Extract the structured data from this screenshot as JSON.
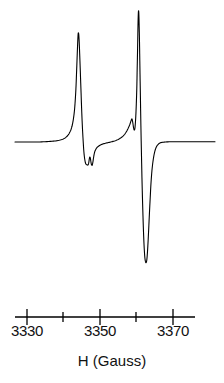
{
  "chart_data": {
    "type": "line",
    "title": "",
    "subtitle": "",
    "xlabel": "H (Gauss)",
    "ylabel": "",
    "xlim": [
      3325.4,
      3378.4
    ],
    "ylim": [
      -1.16,
      1.06
    ],
    "grid": false,
    "legend": null,
    "axis": {
      "ticks": [
        3330,
        3340,
        3350,
        3360,
        3370
      ],
      "tick_labels": [
        "3330",
        "",
        "3350",
        "",
        "3370"
      ],
      "labeled_ticks": [
        3330,
        3350,
        3370
      ],
      "minor_ticks": [
        3340,
        3360
      ],
      "line_color": "#000000"
    },
    "annotations": [],
    "series": [
      {
        "name": "EPR first-derivative signal",
        "color": "#000000",
        "description": "Two-line first-derivative EPR spectrum with small hyperfine shoulders",
        "features": [
          {
            "name": "left-peak-maximum",
            "x": 3337.3,
            "y": 0.96
          },
          {
            "name": "left-zero-crossing",
            "x": 3338.6,
            "y": 0.0
          },
          {
            "name": "left-hyperfine-shoulder",
            "x": 3340.9,
            "y": -0.08
          },
          {
            "name": "left-peak-minimum",
            "x": 3340.5,
            "y": -1.16
          },
          {
            "name": "right-hyperfine-shoulder",
            "x": 3352.4,
            "y": 0.17
          },
          {
            "name": "right-peak-maximum",
            "x": 3354.1,
            "y": 1.06
          },
          {
            "name": "right-zero-crossing",
            "x": 3355.2,
            "y": 0.0
          },
          {
            "name": "right-peak-minimum",
            "x": 3356.2,
            "y": -0.97
          }
        ],
        "points_px": [
          [
            15,
            142
          ],
          [
            22,
            142
          ],
          [
            30,
            142
          ],
          [
            38,
            142
          ],
          [
            45,
            141.7
          ],
          [
            52,
            141.3
          ],
          [
            57,
            140.7
          ],
          [
            61,
            139.8
          ],
          [
            64,
            138.6
          ],
          [
            66,
            137.2
          ],
          [
            68,
            135.2
          ],
          [
            69.5,
            132.8
          ],
          [
            71,
            129.5
          ],
          [
            72.3,
            125
          ],
          [
            73.4,
            119
          ],
          [
            74.4,
            111
          ],
          [
            75.2,
            101
          ],
          [
            75.9,
            89
          ],
          [
            76.5,
            74
          ],
          [
            77.1,
            58
          ],
          [
            77.6,
            45
          ],
          [
            78,
            36
          ],
          [
            78.3,
            33
          ],
          [
            78.7,
            34
          ],
          [
            79.1,
            40
          ],
          [
            79.6,
            52
          ],
          [
            80.2,
            68
          ],
          [
            80.9,
            88
          ],
          [
            81.6,
            108
          ],
          [
            82.3,
            125
          ],
          [
            83.1,
            140
          ],
          [
            83.9,
            152
          ],
          [
            84.7,
            159
          ],
          [
            85.5,
            163
          ],
          [
            86.3,
            164.5
          ],
          [
            87.1,
            164.8
          ],
          [
            88,
            165
          ],
          [
            88.7,
            163
          ],
          [
            89.3,
            159
          ],
          [
            89.8,
            157
          ],
          [
            90.3,
            158
          ],
          [
            90.8,
            161
          ],
          [
            91.3,
            164
          ],
          [
            91.8,
            165.2
          ],
          [
            92.3,
            165
          ],
          [
            92.9,
            162
          ],
          [
            93.5,
            158
          ],
          [
            94.2,
            154
          ],
          [
            95,
            151
          ],
          [
            96,
            149
          ],
          [
            97,
            147.5
          ],
          [
            98.5,
            146.2
          ],
          [
            100,
            145.2
          ],
          [
            102,
            144.3
          ],
          [
            104,
            143.6
          ],
          [
            107,
            142.9
          ],
          [
            110,
            142.2
          ],
          [
            113,
            141.4
          ],
          [
            116,
            140.4
          ],
          [
            119,
            139
          ],
          [
            122,
            137
          ],
          [
            124.5,
            134.5
          ],
          [
            126.5,
            131.5
          ],
          [
            128.3,
            128
          ],
          [
            129.8,
            124.5
          ],
          [
            130.8,
            121.5
          ],
          [
            131.5,
            119.5
          ],
          [
            132,
            119
          ],
          [
            132.5,
            121
          ],
          [
            133,
            124
          ],
          [
            133.6,
            128
          ],
          [
            134.2,
            130
          ],
          [
            134.8,
            129
          ],
          [
            135.3,
            124
          ],
          [
            135.8,
            116
          ],
          [
            136.3,
            104
          ],
          [
            136.8,
            88
          ],
          [
            137.2,
            68
          ],
          [
            137.6,
            48
          ],
          [
            137.9,
            30
          ],
          [
            138.2,
            17
          ],
          [
            138.5,
            11
          ],
          [
            138.8,
            13
          ],
          [
            139.1,
            23
          ],
          [
            139.5,
            42
          ],
          [
            139.9,
            67
          ],
          [
            140.4,
            96
          ],
          [
            140.9,
            126
          ],
          [
            141.5,
            156
          ],
          [
            142.1,
            184
          ],
          [
            142.8,
            210
          ],
          [
            143.5,
            232
          ],
          [
            144.2,
            248
          ],
          [
            144.9,
            258
          ],
          [
            145.6,
            262
          ],
          [
            146.2,
            262.5
          ],
          [
            146.8,
            260
          ],
          [
            147.4,
            253
          ],
          [
            148,
            243
          ],
          [
            148.7,
            229
          ],
          [
            149.4,
            214
          ],
          [
            150.2,
            198
          ],
          [
            151,
            183
          ],
          [
            151.9,
            171
          ],
          [
            152.9,
            162
          ],
          [
            154,
            155
          ],
          [
            155.2,
            150
          ],
          [
            156.6,
            146.5
          ],
          [
            158.2,
            144.3
          ],
          [
            160,
            143
          ],
          [
            162,
            142.4
          ],
          [
            165,
            142
          ],
          [
            169,
            141.8
          ],
          [
            174,
            141.8
          ],
          [
            180,
            141.8
          ],
          [
            188,
            141.8
          ],
          [
            197,
            141.8
          ],
          [
            206,
            141.8
          ],
          [
            215,
            141.8
          ]
        ]
      }
    ]
  },
  "axis_geometry": {
    "baseline_y_px": 142,
    "axis_line_y_px": 317,
    "axis_x_start_px": 15,
    "axis_x_end_px": 195,
    "tick_positions_px": [
      27,
      63,
      100,
      136,
      173
    ],
    "major_tick_indices": [
      0,
      2,
      4
    ],
    "major_tick_length_px": 14,
    "minor_tick_length_px": 10
  },
  "labels": {
    "tick_3330": "3330",
    "tick_3350": "3350",
    "tick_3370": "3370",
    "axis_title": "H (Gauss)"
  },
  "colors": {
    "background": "#ffffff",
    "trace": "#000000",
    "axis": "#000000",
    "text": "#111111"
  }
}
